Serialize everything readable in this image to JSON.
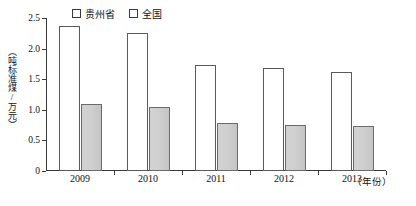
{
  "chart_data": {
    "type": "bar",
    "title": "",
    "xlabel": "（年份）",
    "ylabel": "（吨标准煤/万元）",
    "categories": [
      "2009",
      "2010",
      "2011",
      "2012",
      "2013"
    ],
    "series": [
      {
        "name": "贵州省",
        "values": [
          2.37,
          2.26,
          1.74,
          1.68,
          1.62
        ],
        "fill": "#ffffff"
      },
      {
        "name": "全国",
        "values": [
          1.09,
          1.04,
          0.79,
          0.76,
          0.73
        ],
        "fill": "#cfcfcf"
      }
    ],
    "ylim": [
      0,
      2.5
    ],
    "yticks": [
      "0",
      "0.5",
      "1.0",
      "1.5",
      "2.0",
      "2.5"
    ],
    "ytick_values": [
      0,
      0.5,
      1.0,
      1.5,
      2.0,
      2.5
    ],
    "grid": false,
    "legend_position": "top-left"
  },
  "axis": {
    "y_unit_label": "（吨标准煤/万元）",
    "x_unit_label": "（年份）"
  },
  "legend": {
    "items": [
      {
        "label": "贵州省",
        "swatch": "legend-swatch-white"
      },
      {
        "label": "全国",
        "swatch": "legend-swatch-gray"
      }
    ]
  }
}
